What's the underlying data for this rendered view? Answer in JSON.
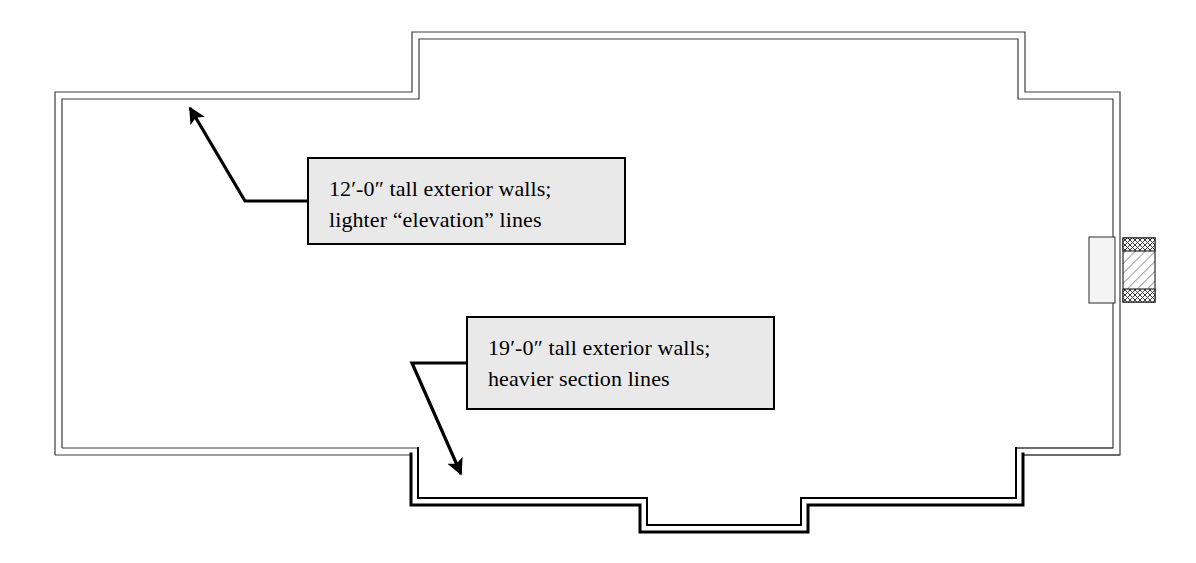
{
  "diagram": {
    "type": "architectural-floor-plan",
    "canvas": {
      "width": 1196,
      "height": 563
    },
    "colors": {
      "background": "#ffffff",
      "line": "#000000",
      "light_line": "#5a5a5a",
      "callout_fill": "#e9e9e9",
      "callout_border": "#000000",
      "hatch": "#404040"
    },
    "line_weights": {
      "elevation_light": 1.1,
      "section_heavy": 2.6,
      "wall_thickness": 7
    }
  },
  "callouts": [
    {
      "id": "elevation",
      "name": "12ft-wall-callout",
      "line1": "12′-0″ tall exterior walls;",
      "line2": "lighter “elevation” lines",
      "box": {
        "x": 307,
        "y": 157,
        "w": 319,
        "h": 88
      },
      "leader": {
        "elbow": [
          307,
          201
        ],
        "bend": [
          245,
          201
        ],
        "tip": [
          184,
          102
        ]
      }
    },
    {
      "id": "section",
      "name": "19ft-wall-callout",
      "line1": "19′-0″ tall exterior walls;",
      "line2": "heavier section lines",
      "box": {
        "x": 466,
        "y": 316,
        "w": 309,
        "h": 94
      },
      "leader": {
        "elbow": [
          466,
          363
        ],
        "bend": [
          412,
          363
        ],
        "tip": [
          466,
          482
        ]
      }
    }
  ],
  "plan": {
    "outer_outline": "M 55,92 L 55,455 L 412,455 L 412,505 L 640,505 L 640,532 L 808,532 L 808,505 L 1022,505 L 1022,455 L 1120,455 L 1120,92 L 1025,92 L 1025,32 L 412,32 L 412,92 Z",
    "inner_outline": "M 62,99 L 62,448 L 419,448 L 419,498 L 647,498 L 647,525 L 801,525 L 801,498 L 1015,498 L 1015,448 L 1113,448 L 1113,99 L 1018,99 L 1018,39 L 419,39 L 419,99 Z",
    "segments": [
      {
        "name": "west-wall",
        "weight": "light",
        "from": [
          55,
          92
        ],
        "to": [
          55,
          455
        ]
      },
      {
        "name": "north-west-wall",
        "weight": "light",
        "from": [
          55,
          92
        ],
        "to": [
          412,
          92
        ]
      },
      {
        "name": "north-step-wall",
        "weight": "light",
        "from": [
          412,
          32
        ],
        "to": [
          412,
          92
        ]
      },
      {
        "name": "north-main-wall",
        "weight": "light",
        "from": [
          412,
          32
        ],
        "to": [
          1025,
          32
        ]
      },
      {
        "name": "north-east-step-wall",
        "weight": "light",
        "from": [
          1025,
          32
        ],
        "to": [
          1025,
          92
        ]
      },
      {
        "name": "north-east-wall",
        "weight": "light",
        "from": [
          1025,
          92
        ],
        "to": [
          1120,
          92
        ]
      },
      {
        "name": "east-wall",
        "weight": "light",
        "from": [
          1120,
          92
        ],
        "to": [
          1120,
          455
        ]
      },
      {
        "name": "south-east-wall",
        "weight": "light",
        "from": [
          1022,
          455
        ],
        "to": [
          1120,
          455
        ]
      },
      {
        "name": "south-west-wall",
        "weight": "light",
        "from": [
          55,
          455
        ],
        "to": [
          412,
          455
        ]
      },
      {
        "name": "south-step-west",
        "weight": "heavy",
        "from": [
          412,
          455
        ],
        "to": [
          412,
          505
        ]
      },
      {
        "name": "south-main-wall-left",
        "weight": "heavy",
        "from": [
          412,
          505
        ],
        "to": [
          640,
          505
        ]
      },
      {
        "name": "south-bump-west",
        "weight": "heavy",
        "from": [
          640,
          505
        ],
        "to": [
          640,
          532
        ]
      },
      {
        "name": "south-bump-bottom",
        "weight": "heavy",
        "from": [
          640,
          532
        ],
        "to": [
          808,
          532
        ]
      },
      {
        "name": "south-bump-east",
        "weight": "heavy",
        "from": [
          808,
          505
        ],
        "to": [
          808,
          532
        ]
      },
      {
        "name": "south-main-wall-right",
        "weight": "heavy",
        "from": [
          808,
          505
        ],
        "to": [
          1022,
          505
        ]
      },
      {
        "name": "south-step-east",
        "weight": "heavy",
        "from": [
          1022,
          455
        ],
        "to": [
          1022,
          505
        ]
      }
    ],
    "wall_detail": {
      "name": "east-wall-section-detail",
      "inner_block": {
        "x": 1089,
        "y": 237,
        "w": 26,
        "h": 66
      },
      "hatch_block": {
        "x": 1123,
        "y": 238,
        "w": 32,
        "h": 64
      },
      "cap_top": {
        "x": 1123,
        "y": 238,
        "w": 32,
        "h": 12
      },
      "cap_bottom": {
        "x": 1123,
        "y": 290,
        "w": 32,
        "h": 12
      }
    }
  }
}
